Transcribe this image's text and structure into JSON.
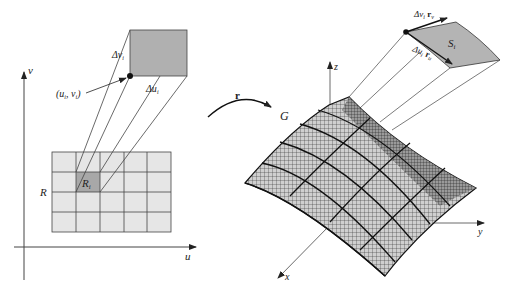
{
  "figure": {
    "left_panel": {
      "axis_v_label": "v",
      "axis_u_label": "u",
      "region_label": "R",
      "cell_label_main": "R",
      "cell_label_sub": "i",
      "grid": {
        "cols": 5,
        "rows": 4,
        "highlight_col": 1,
        "highlight_row": 1
      },
      "point_label": "(u",
      "point_label_sub1": "i",
      "point_label_mid": ", v",
      "point_label_sub2": "i",
      "point_label_end": ")",
      "delta_v_label": "Δv",
      "delta_v_sub": "i",
      "delta_u_label": "Δu",
      "delta_u_sub": "i"
    },
    "mapping": {
      "arrow_label": "r"
    },
    "right_panel": {
      "surface_label": "G",
      "axis_z_label": "z",
      "axis_y_label": "y",
      "axis_x_label": "x",
      "patch_label": "S",
      "patch_sub": "i",
      "tangent_v_label": "Δv",
      "tangent_v_sub": "i",
      "tangent_v_vec": "r",
      "tangent_v_vec_sub": "v",
      "tangent_u_label": "Δu",
      "tangent_u_sub": "i",
      "tangent_u_vec": "r",
      "tangent_u_vec_sub": "u"
    },
    "colors": {
      "grid_fill": "#e6e6e6",
      "highlight_fill": "#a8a8a8",
      "patch_fill": "#b4b4b4",
      "line": "#444444",
      "mesh": "#333333"
    }
  }
}
